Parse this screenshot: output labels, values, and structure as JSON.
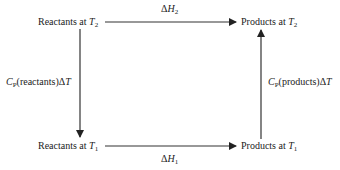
{
  "diagram": {
    "type": "thermodynamic-cycle",
    "nodes": {
      "top_left": {
        "text": "Reactants at ",
        "var": "T",
        "sub": "2"
      },
      "top_right": {
        "text": "Products at ",
        "var": "T",
        "sub": "2"
      },
      "bottom_left": {
        "text": "Reactants at ",
        "var": "T",
        "sub": "1"
      },
      "bottom_right": {
        "text": "Products at ",
        "var": "T",
        "sub": "1"
      }
    },
    "edges": {
      "top": {
        "pre": "Δ",
        "var": "H",
        "sub": "2",
        "from": "top_left",
        "to": "top_right"
      },
      "bottom": {
        "pre": "Δ",
        "var": "H",
        "sub": "1",
        "from": "bottom_left",
        "to": "bottom_right"
      },
      "left": {
        "var": "C",
        "sub": "P",
        "text": "(reactants)Δ",
        "var2": "T",
        "from": "top_left",
        "to": "bottom_left"
      },
      "right": {
        "var": "C",
        "sub": "P",
        "text": "(products)Δ",
        "var2": "T",
        "from": "bottom_right",
        "to": "top_right"
      }
    },
    "line_color": "#333333"
  }
}
